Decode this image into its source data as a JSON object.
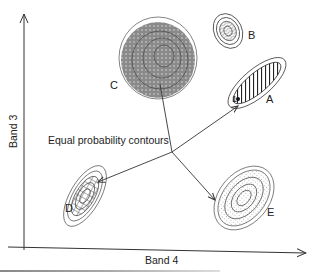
{
  "diagram": {
    "title": "Equal probability contours",
    "x_axis": {
      "label": "Band 4"
    },
    "y_axis": {
      "label": "Band 3"
    },
    "clusters": [
      {
        "id": "A",
        "label": "A",
        "fill": "hatched-diagonal"
      },
      {
        "id": "B",
        "label": "B",
        "fill": "wavy-lines"
      },
      {
        "id": "C",
        "label": "C",
        "fill": "dotted-gray"
      },
      {
        "id": "D",
        "label": "D",
        "fill": "crosshatch"
      },
      {
        "id": "E",
        "label": "E",
        "fill": "stippled"
      }
    ],
    "point": {
      "label": "1"
    },
    "annotation": "Equal probability contours",
    "colors": {
      "line": "#333333",
      "fill_c": "#8a8a8a",
      "text": "#222222"
    }
  }
}
